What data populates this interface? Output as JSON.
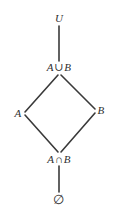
{
  "diagram": {
    "type": "hasse-lattice",
    "title": "",
    "background_color": "#ffffff",
    "line_color": "#3a3a3a",
    "text_color": "#2f2f2f",
    "nodes": [
      {
        "id": "universe",
        "name": "universe-node",
        "text": "U",
        "sym_left": "U",
        "op": "",
        "sym_right": "",
        "x": 59,
        "y": 18
      },
      {
        "id": "union",
        "name": "union-node",
        "text": "A ∪ B",
        "sym_left": "A",
        "op": "∪",
        "sym_right": "B",
        "x": 59,
        "y": 67
      },
      {
        "id": "set-a",
        "name": "set-a-node",
        "text": "A",
        "sym_left": "A",
        "op": "",
        "sym_right": "",
        "x": 18,
        "y": 113
      },
      {
        "id": "set-b",
        "name": "set-b-node",
        "text": "B",
        "sym_left": "B",
        "op": "",
        "sym_right": "",
        "x": 101,
        "y": 110
      },
      {
        "id": "intersection",
        "name": "intersection-node",
        "text": "A ∩ B",
        "sym_left": "A",
        "op": "∩",
        "sym_right": "B",
        "x": 59,
        "y": 159
      },
      {
        "id": "emptyset",
        "name": "emptyset-node",
        "text": "∅",
        "sym_left": "∅",
        "op": "",
        "sym_right": "",
        "x": 59,
        "y": 200
      }
    ],
    "edges": [
      {
        "name": "edge-universe-union",
        "from": "universe",
        "to": "union",
        "x1": 59,
        "y1": 26,
        "x2": 59,
        "y2": 61
      },
      {
        "name": "edge-union-set-a",
        "from": "union",
        "to": "set-a",
        "x1": 58,
        "y1": 75,
        "x2": 25,
        "y2": 112
      },
      {
        "name": "edge-union-set-b",
        "from": "union",
        "to": "set-b",
        "x1": 61,
        "y1": 75,
        "x2": 95,
        "y2": 109
      },
      {
        "name": "edge-set-a-intersection",
        "from": "set-a",
        "to": "intersection",
        "x1": 25,
        "y1": 115,
        "x2": 58,
        "y2": 152
      },
      {
        "name": "edge-set-b-intersection",
        "from": "set-b",
        "to": "intersection",
        "x1": 95,
        "y1": 113,
        "x2": 61,
        "y2": 152
      },
      {
        "name": "edge-intersection-emptyset",
        "from": "intersection",
        "to": "emptyset",
        "x1": 59,
        "y1": 166,
        "x2": 59,
        "y2": 192
      }
    ]
  }
}
